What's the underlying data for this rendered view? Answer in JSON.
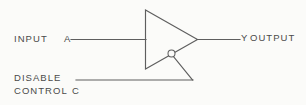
{
  "diagram": {
    "background_color": "#fbfbf9",
    "ink_color": "#5a5a5a",
    "labels": {
      "input": "INPUT",
      "input_pin": "A",
      "output_pin": "Y",
      "output": "OUTPUT",
      "disable": "DISABLE",
      "control": "CONTROL",
      "control_pin": "C"
    },
    "symbols": {
      "buffer_triangle": "amplifier-buffer-triangle",
      "inversion_bubble": "active-low-bubble",
      "input_wire": "input-signal-line",
      "output_wire": "output-signal-line",
      "control_wire": "disable-control-line",
      "control_diagonal": "control-diagonal-lead"
    }
  }
}
